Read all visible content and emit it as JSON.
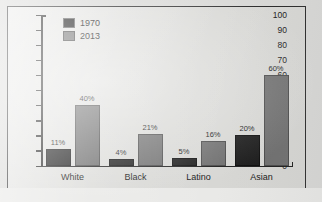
{
  "chart_data": {
    "type": "bar",
    "title": "",
    "subtitle": "",
    "xlabel": "",
    "ylabel": "",
    "categories": [
      "White",
      "Black",
      "Latino",
      "Asian"
    ],
    "series": [
      {
        "name": "1970",
        "color": "#1b1b1b",
        "values": [
          11,
          4,
          5,
          20
        ],
        "value_labels": [
          "11%",
          "4%",
          "5%",
          "20%"
        ]
      },
      {
        "name": "2013",
        "color": "#6f6f6f",
        "values": [
          40,
          21,
          16,
          60
        ],
        "value_labels": [
          "40%",
          "21%",
          "16%",
          "60%"
        ]
      }
    ],
    "ylim": [
      0,
      100
    ],
    "ytick_step": 10,
    "ytick_labels": [
      "100",
      "90",
      "80",
      "70",
      "60",
      "50",
      "40",
      "30",
      "20",
      "10",
      "0"
    ],
    "grid": false,
    "legend_position": "top-left-inside"
  },
  "legend": {
    "entries": [
      {
        "label": "1970",
        "swatch": "legend-swatch-1970"
      },
      {
        "label": "2013",
        "swatch": "legend-swatch-2013"
      }
    ]
  },
  "colors": {
    "series_1970": "#1b1b1b",
    "series_2013": "#6f6f6f",
    "frame": "#2b2b2b",
    "plot_background": "#d6d6d3",
    "page_background": "#d8d8d6"
  }
}
